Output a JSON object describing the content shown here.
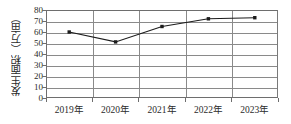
{
  "chart_data": {
    "type": "line",
    "title": "",
    "xlabel": "",
    "ylabel": "发生面积（万亩）",
    "categories": [
      "2019年",
      "2020年",
      "2021年",
      "2022年",
      "2023年"
    ],
    "values": [
      60,
      51,
      65,
      72,
      73
    ],
    "series": [
      {
        "name": "发生面积",
        "values": [
          60,
          51,
          65,
          72,
          73
        ]
      }
    ],
    "ylim": [
      0,
      80
    ],
    "yticks": [
      0,
      10,
      20,
      30,
      40,
      50,
      60,
      70,
      80
    ],
    "ytick_labels": [
      "0",
      "10",
      "20",
      "30",
      "40",
      "50",
      "60",
      "70",
      "80"
    ],
    "grid": "horizontal",
    "legend": "none",
    "marker": "square",
    "line_color": "#1c1c1c",
    "grid_color": "#8a8a8a",
    "axis_color": "#6e6e6e",
    "background": "#ffffff"
  }
}
